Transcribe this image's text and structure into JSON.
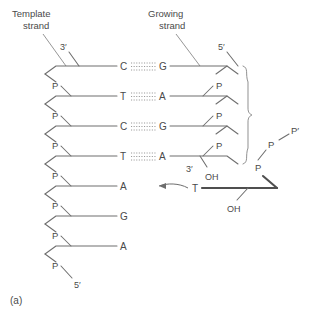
{
  "figure": {
    "panel_label": "(a)",
    "labels": {
      "template_strand_line1": "Template",
      "template_strand_line2": "strand",
      "growing_strand_line1": "Growing",
      "growing_strand_line2": "strand"
    },
    "colors": {
      "background": "#ffffff",
      "line": "#6e6e6e",
      "text": "#4a4a4a",
      "hydrogen_bond": "#9a9a9a",
      "incoming_bond": "#4f4f4f"
    },
    "termini": {
      "template_top": "3′",
      "template_bottom": "5′",
      "growing_top": "5′",
      "growing_three_prime": "3′",
      "growing_hydroxyl": "OH",
      "incoming_hydroxyl": "OH"
    },
    "template_strand": {
      "name": "Template strand",
      "direction_top": "3′",
      "direction_bottom": "5′",
      "bases": [
        "C",
        "T",
        "C",
        "T",
        "A",
        "G",
        "A"
      ],
      "phosphate_label": "P",
      "phosphate_count": 7
    },
    "growing_strand": {
      "name": "Growing strand",
      "direction_top": "5′",
      "bases": [
        "G",
        "A",
        "G",
        "A"
      ],
      "phosphate_label": "P",
      "phosphate_count": 3
    },
    "base_pairs": [
      {
        "template": "C",
        "growing": "G",
        "bonds": 3
      },
      {
        "template": "T",
        "growing": "A",
        "bonds": 3
      },
      {
        "template": "C",
        "growing": "G",
        "bonds": 3
      },
      {
        "template": "T",
        "growing": "A",
        "bonds": 3
      }
    ],
    "unpaired_template_bases": [
      "A",
      "G",
      "A"
    ],
    "incoming_nucleotide": {
      "base": "T",
      "hydroxyl": "OH",
      "phosphates": [
        "P",
        "P",
        "P′"
      ]
    },
    "brace": {
      "spans_pairs": 4
    }
  }
}
